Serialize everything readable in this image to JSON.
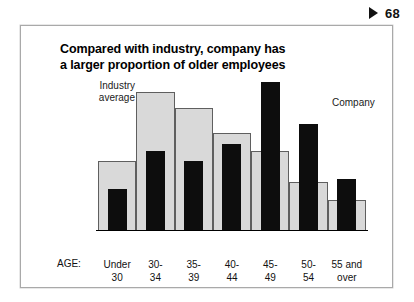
{
  "page_marker": {
    "icon": "play-triangle-icon",
    "number": "68"
  },
  "title": {
    "line1": "Compared with industry, company has",
    "line2": "a larger proportion of older employees"
  },
  "legend": {
    "industry": {
      "line1": "Industry",
      "line2": "average"
    },
    "company": "Company"
  },
  "axis": {
    "title": "AGE:"
  },
  "colors": {
    "industry_fill": "#d9d9d9",
    "industry_stroke": "#5f5f5f",
    "company_fill": "#0d0d0d",
    "frame": "#a9a9a9",
    "text": "#111111"
  },
  "chart_data": {
    "type": "bar",
    "title": "Compared with industry, company has a larger proportion of older employees",
    "xlabel": "AGE:",
    "ylabel": "",
    "grid": false,
    "legend_position": "in-plot",
    "ylim": [
      0,
      110
    ],
    "categories": [
      "Under 30",
      "30-34",
      "35-39",
      "40-44",
      "45-49",
      "50-54",
      "55 and over"
    ],
    "category_lines": [
      [
        "Under",
        "30"
      ],
      [
        "30-",
        "34"
      ],
      [
        "35-",
        "39"
      ],
      [
        "40-",
        "44"
      ],
      [
        "45-",
        "49"
      ],
      [
        "50-",
        "54"
      ],
      [
        "55 and",
        "over"
      ]
    ],
    "series": [
      {
        "name": "Industry average",
        "style": "light-gray-step",
        "values": [
          50,
          100,
          88,
          70,
          57,
          35,
          22
        ]
      },
      {
        "name": "Company",
        "style": "black-overlay",
        "values": [
          30,
          57,
          50,
          62,
          107,
          77,
          37
        ]
      }
    ]
  }
}
